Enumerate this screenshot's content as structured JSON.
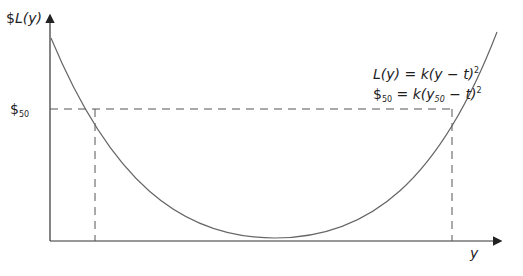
{
  "diagram": {
    "y_axis_label": {
      "prefix": "$",
      "fn": "L(y)"
    },
    "x_axis_label": "y",
    "threshold_label": {
      "symbol": "$",
      "subscript": "50"
    },
    "equations": [
      {
        "lhs": "L(y)",
        "rhs": "= k(y − t)",
        "sup": "2"
      },
      {
        "lhs_symbol": "$",
        "lhs_sub": "50",
        "rhs_a": "= k(y",
        "rhs_sub": "50",
        "rhs_b": " − t)",
        "sup": "2"
      }
    ],
    "colors": {
      "axis": "#333333",
      "curve": "#555555",
      "dashed": "#555555"
    }
  }
}
